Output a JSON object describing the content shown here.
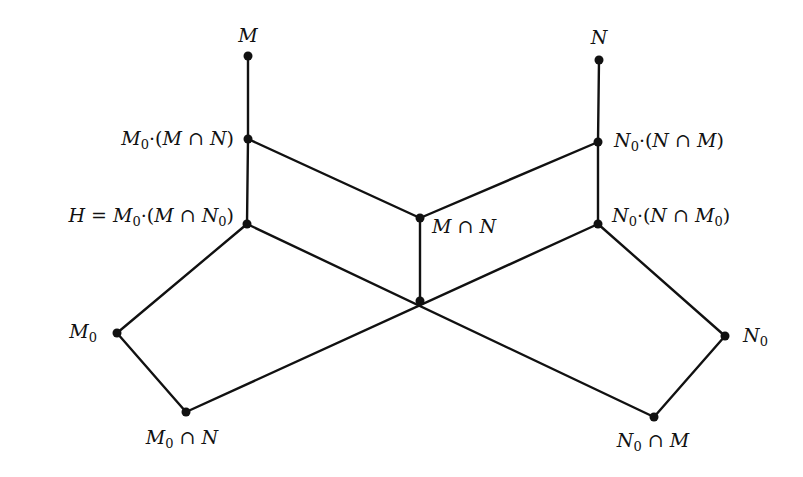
{
  "diagram": {
    "type": "subgroup-lattice",
    "nodes": [
      {
        "id": "M",
        "x": 248,
        "y": 56,
        "label": "M",
        "label_parts": [
          [
            "i",
            "M"
          ]
        ],
        "label_x": 248,
        "label_y": 26,
        "anchor": "center"
      },
      {
        "id": "M0_MN",
        "x": 248,
        "y": 139,
        "label": "M0·(M∩N)",
        "label_parts": [
          [
            "i",
            "M"
          ],
          [
            "s",
            "0"
          ],
          [
            "o",
            "·("
          ],
          [
            "i",
            "M"
          ],
          [
            "o",
            " ∩ "
          ],
          [
            "i",
            "N"
          ],
          [
            "o",
            ")"
          ]
        ],
        "label_x": 234,
        "label_y": 129,
        "anchor": "right"
      },
      {
        "id": "H",
        "x": 247,
        "y": 224,
        "label": "H = M0·(M∩N0)",
        "label_parts": [
          [
            "i",
            "H"
          ],
          [
            "o",
            " = "
          ],
          [
            "i",
            "M"
          ],
          [
            "s",
            "0"
          ],
          [
            "o",
            "·("
          ],
          [
            "i",
            "M"
          ],
          [
            "o",
            " ∩ "
          ],
          [
            "i",
            "N"
          ],
          [
            "s",
            "0"
          ],
          [
            "o",
            ")"
          ]
        ],
        "label_x": 234,
        "label_y": 206,
        "anchor": "right"
      },
      {
        "id": "N",
        "x": 599,
        "y": 60,
        "label": "N",
        "label_parts": [
          [
            "i",
            "N"
          ]
        ],
        "label_x": 599,
        "label_y": 28,
        "anchor": "center"
      },
      {
        "id": "N0_NM",
        "x": 598,
        "y": 142,
        "label": "N0·(N∩M)",
        "label_parts": [
          [
            "i",
            "N"
          ],
          [
            "s",
            "0"
          ],
          [
            "o",
            "·("
          ],
          [
            "i",
            "N"
          ],
          [
            "o",
            " ∩ "
          ],
          [
            "i",
            "M"
          ],
          [
            "o",
            ")"
          ]
        ],
        "label_x": 614,
        "label_y": 131,
        "anchor": "left"
      },
      {
        "id": "N0_NM0",
        "x": 598,
        "y": 224,
        "label": "N0·(N∩M0)",
        "label_parts": [
          [
            "i",
            "N"
          ],
          [
            "s",
            "0"
          ],
          [
            "o",
            "·("
          ],
          [
            "i",
            "N"
          ],
          [
            "o",
            " ∩ "
          ],
          [
            "i",
            "M"
          ],
          [
            "s",
            "0"
          ],
          [
            "o",
            ")"
          ]
        ],
        "label_x": 612,
        "label_y": 206,
        "anchor": "left"
      },
      {
        "id": "MN",
        "x": 420,
        "y": 218,
        "label": "M∩N",
        "label_parts": [
          [
            "i",
            "M"
          ],
          [
            "o",
            " ∩ "
          ],
          [
            "i",
            "N"
          ]
        ],
        "label_x": 432,
        "label_y": 217,
        "anchor": "left"
      },
      {
        "id": "center",
        "x": 420,
        "y": 301,
        "label": "",
        "label_parts": [],
        "label_x": 0,
        "label_y": 0,
        "anchor": "none"
      },
      {
        "id": "M0",
        "x": 117,
        "y": 333,
        "label": "M0",
        "label_parts": [
          [
            "i",
            "M"
          ],
          [
            "s",
            "0"
          ]
        ],
        "label_x": 97,
        "label_y": 322,
        "anchor": "right"
      },
      {
        "id": "M0nN",
        "x": 186,
        "y": 412,
        "label": "M0∩N",
        "label_parts": [
          [
            "i",
            "M"
          ],
          [
            "s",
            "0"
          ],
          [
            "o",
            " ∩ "
          ],
          [
            "i",
            "N"
          ]
        ],
        "label_x": 182,
        "label_y": 428,
        "anchor": "center"
      },
      {
        "id": "N0",
        "x": 725,
        "y": 336,
        "label": "N0",
        "label_parts": [
          [
            "i",
            "N"
          ],
          [
            "s",
            "0"
          ]
        ],
        "label_x": 743,
        "label_y": 326,
        "anchor": "left"
      },
      {
        "id": "N0nM",
        "x": 654,
        "y": 417,
        "label": "N0∩M",
        "label_parts": [
          [
            "i",
            "N"
          ],
          [
            "s",
            "0"
          ],
          [
            "o",
            " ∩ "
          ],
          [
            "i",
            "M"
          ]
        ],
        "label_x": 653,
        "label_y": 431,
        "anchor": "center"
      }
    ],
    "edges": [
      [
        "M",
        "M0_MN"
      ],
      [
        "M0_MN",
        "H"
      ],
      [
        "M0_MN",
        "MN"
      ],
      [
        "N",
        "N0_NM"
      ],
      [
        "N0_NM",
        "N0_NM0"
      ],
      [
        "N0_NM",
        "MN"
      ],
      [
        "MN",
        "center"
      ],
      [
        "H",
        "M0"
      ],
      [
        "H",
        "N0nM"
      ],
      [
        "N0_NM0",
        "N0"
      ],
      [
        "N0_NM0",
        "M0nN"
      ],
      [
        "M0",
        "M0nN"
      ],
      [
        "N0",
        "N0nM"
      ]
    ],
    "colors": {
      "line": "#111111",
      "node": "#111111",
      "background": "#ffffff"
    },
    "node_radius": 4.5
  }
}
